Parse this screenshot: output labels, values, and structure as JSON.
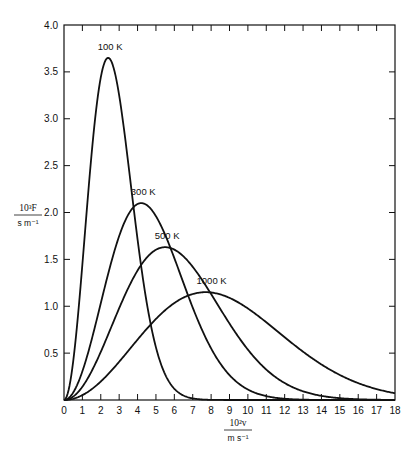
{
  "chart_data": {
    "type": "line",
    "title": "",
    "xlabel": "10^2 v / m s^-1",
    "ylabel": "10^3 F / s m^-1",
    "ylabel_parts": {
      "numerator": "10³F",
      "denominator": "s m⁻¹"
    },
    "xlabel_parts": {
      "numerator": "10²v",
      "denominator": "m s⁻¹"
    },
    "xlim": [
      0,
      18
    ],
    "ylim": [
      0,
      4.0
    ],
    "x_ticks": [
      0,
      1,
      2,
      3,
      4,
      5,
      6,
      7,
      8,
      9,
      10,
      11,
      12,
      13,
      14,
      15,
      16,
      17,
      18
    ],
    "x_tick_labels": [
      "0",
      "1",
      "2",
      "3",
      "4",
      "5",
      "6",
      "7",
      "8",
      "9",
      "10",
      "11",
      "12",
      "13",
      "14",
      "15",
      "16",
      "17",
      "18"
    ],
    "y_ticks": [
      0.5,
      1.0,
      1.5,
      2.0,
      2.5,
      3.0,
      3.5,
      4.0
    ],
    "y_tick_labels": [
      "0.5",
      "1.0",
      "1.5",
      "2.0",
      "2.5",
      "3.0",
      "3.5",
      "4.0"
    ],
    "grid": false,
    "legend": "inline labels at curve peaks",
    "series": [
      {
        "name": "100 K",
        "label": "100 K",
        "peak_x": 2.4,
        "peak_y": 3.65,
        "x": [
          0,
          0.5,
          1,
          1.5,
          2,
          2.5,
          3,
          3.5,
          4,
          4.5,
          5,
          5.5,
          6,
          6.5,
          7,
          8,
          9,
          10
        ],
        "values": [
          0,
          0.37,
          1.29,
          2.4,
          3.28,
          3.64,
          3.39,
          2.69,
          1.83,
          1.07,
          0.54,
          0.23,
          0.09,
          0.03,
          0.01,
          0,
          0,
          0
        ]
      },
      {
        "name": "300 K",
        "label": "300 K",
        "peak_x": 4.2,
        "peak_y": 2.1,
        "x": [
          0,
          1,
          2,
          3,
          4,
          5,
          6,
          7,
          8,
          9,
          10,
          11,
          12,
          13,
          14
        ],
        "values": [
          0,
          0.24,
          0.83,
          1.55,
          2.06,
          2.03,
          1.52,
          0.88,
          0.4,
          0.14,
          0.04,
          0.01,
          0,
          0,
          0
        ]
      },
      {
        "name": "500 K",
        "label": "500 K",
        "peak_x": 5.5,
        "peak_y": 1.63,
        "x": [
          0,
          1,
          2,
          3,
          4,
          5,
          6,
          7,
          8,
          9,
          10,
          11,
          12,
          13,
          14,
          15,
          16
        ],
        "values": [
          0,
          0.11,
          0.41,
          0.84,
          1.28,
          1.57,
          1.6,
          1.38,
          1.01,
          0.64,
          0.35,
          0.16,
          0.07,
          0.02,
          0.01,
          0,
          0
        ]
      },
      {
        "name": "1000 K",
        "label": "1000 K",
        "peak_x": 7.7,
        "peak_y": 1.15,
        "x": [
          0,
          1,
          2,
          3,
          4,
          5,
          6,
          7,
          8,
          9,
          10,
          11,
          12,
          13,
          14,
          15,
          16,
          17,
          18
        ],
        "values": [
          0,
          0.04,
          0.15,
          0.32,
          0.52,
          0.73,
          0.92,
          1.07,
          1.14,
          1.12,
          1.03,
          0.87,
          0.69,
          0.51,
          0.35,
          0.23,
          0.14,
          0.08,
          0.04
        ]
      }
    ],
    "curve_params": {
      "100 K": {
        "peak_x": 2.4,
        "peak_y": 3.65
      },
      "300 K": {
        "peak_x": 4.2,
        "peak_y": 2.1
      },
      "500 K": {
        "peak_x": 5.5,
        "peak_y": 1.63
      },
      "1000 K": {
        "peak_x": 7.7,
        "peak_y": 1.15
      }
    }
  },
  "colors": {
    "line": "#111111",
    "background": "#ffffff"
  }
}
